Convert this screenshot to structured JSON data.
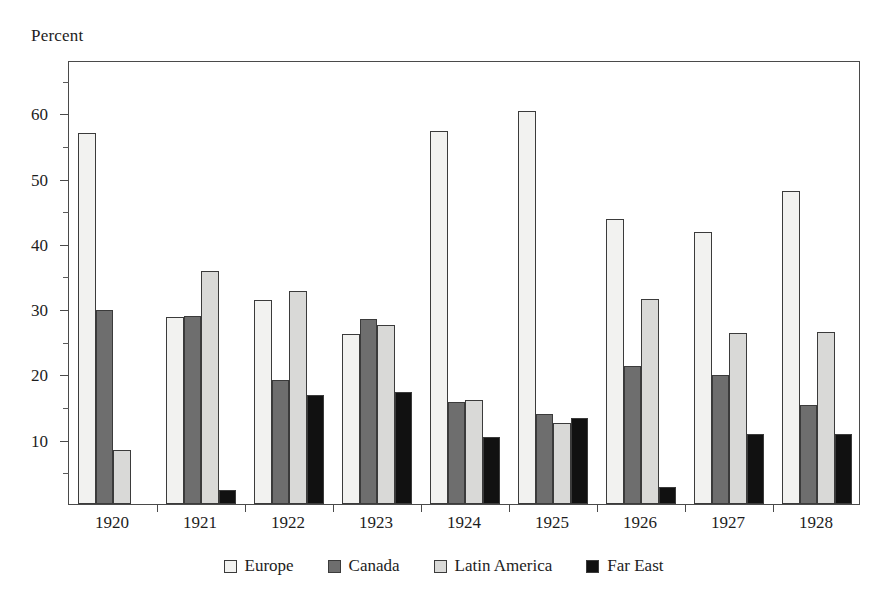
{
  "chart_data": {
    "type": "bar",
    "title": "",
    "ylabel": "Percent",
    "xlabel": "",
    "ylim": [
      0,
      68
    ],
    "yticks": [
      10,
      20,
      30,
      40,
      50,
      60
    ],
    "yticks_minor": [
      5,
      15,
      25,
      35,
      45,
      55,
      65
    ],
    "grid": false,
    "legend_position": "bottom",
    "categories": [
      "1920",
      "1921",
      "1922",
      "1923",
      "1924",
      "1925",
      "1926",
      "1927",
      "1928"
    ],
    "series": [
      {
        "name": "Europe",
        "color": "#f2f2f0",
        "values": [
          56.8,
          28.6,
          31.3,
          26.0,
          57.2,
          60.2,
          43.7,
          41.7,
          48.0
        ]
      },
      {
        "name": "Canada",
        "color": "#6e6e6e",
        "values": [
          29.7,
          28.8,
          19.0,
          28.4,
          15.7,
          13.8,
          21.2,
          19.7,
          15.1
        ]
      },
      {
        "name": "Latin America",
        "color": "#d9d9d7",
        "values": [
          8.3,
          35.7,
          32.6,
          27.4,
          16.0,
          12.4,
          31.4,
          26.2,
          26.4
        ]
      },
      {
        "name": "Far East",
        "color": "#111111",
        "values": [
          null,
          2.1,
          16.7,
          17.2,
          10.3,
          13.1,
          2.6,
          10.7,
          10.7
        ]
      }
    ]
  },
  "axis": {
    "y_title": "Percent"
  },
  "legend": {
    "items": [
      {
        "label": "Europe",
        "color": "#f2f2f0"
      },
      {
        "label": "Canada",
        "color": "#6e6e6e"
      },
      {
        "label": "Latin America",
        "color": "#d9d9d7"
      },
      {
        "label": "Far East",
        "color": "#111111"
      }
    ]
  }
}
